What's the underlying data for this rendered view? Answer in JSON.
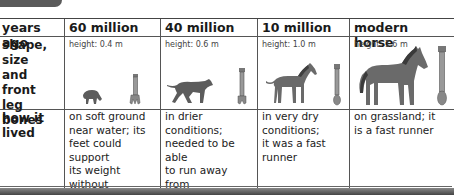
{
  "table": {
    "header": {
      "label": "years ago",
      "columns": [
        "60 million",
        "40 million",
        "10 million",
        "modern horse"
      ]
    },
    "shape_row": {
      "label": "shape, size and front leg bones",
      "label_lines": [
        "shape, size",
        "and front",
        "leg bones"
      ],
      "cells": [
        {
          "height": "height: 0.4 m",
          "animal": "small-grazing-animal-icon",
          "bone": "four-toed-leg-bone-icon"
        },
        {
          "height": "height: 0.6 m",
          "animal": "running-dog-like-animal-icon",
          "bone": "three-toed-leg-bone-icon"
        },
        {
          "height": "height: 1.0 m",
          "animal": "small-horse-icon",
          "bone": "three-toed-long-leg-bone-icon"
        },
        {
          "height": "height: 1.6 m",
          "animal": "modern-horse-icon",
          "bone": "single-hoof-leg-bone-icon"
        }
      ]
    },
    "lived_row": {
      "label_lines": [
        "how it",
        "lived"
      ],
      "cells": [
        [
          "on soft ground",
          "near water; its",
          "feet could support",
          "its weight without",
          "sinking into the",
          "mud"
        ],
        [
          "in drier conditions;",
          "needed to be able",
          "to run away from",
          "predators"
        ],
        [
          "in very dry",
          "conditions;",
          "it was a fast",
          "runner"
        ],
        [
          "on grassland; it",
          "is a fast runner"
        ]
      ]
    }
  },
  "colors": {
    "animal_fill": "#5c5c5c",
    "bone_fill": "#8a8a8a",
    "grid": "#555555",
    "tab": "#5a5a5a"
  }
}
